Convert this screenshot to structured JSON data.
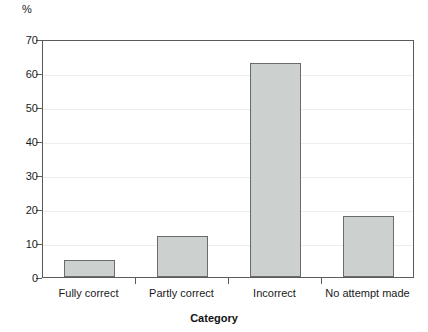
{
  "chart_data": {
    "type": "bar",
    "title": "",
    "subtitle": "",
    "xlabel": "Category",
    "ylabel": "%",
    "categories": [
      "Fully correct",
      "Partly correct",
      "Incorrect",
      "No attempt made"
    ],
    "values": [
      5,
      12,
      63,
      18
    ],
    "series": [
      {
        "name": "Percentage of responses",
        "values": [
          5,
          12,
          63,
          18
        ]
      }
    ],
    "ylim": [
      0,
      70
    ],
    "yticks": [
      0,
      10,
      20,
      30,
      40,
      50,
      60,
      70
    ],
    "ytick_labels": [
      "0",
      "10",
      "20",
      "30",
      "40",
      "50",
      "60",
      "70"
    ],
    "grid": true,
    "grid_axis": "y",
    "legend": false,
    "legend_position": "none",
    "annotations": [],
    "colors": {
      "bar_fill": "#ccd0cf",
      "bar_edge": "#6b6b6b",
      "axis": "#5a5a5a",
      "gridline": "#ededed",
      "text": "#1a1a1a",
      "background": "#ffffff"
    }
  }
}
